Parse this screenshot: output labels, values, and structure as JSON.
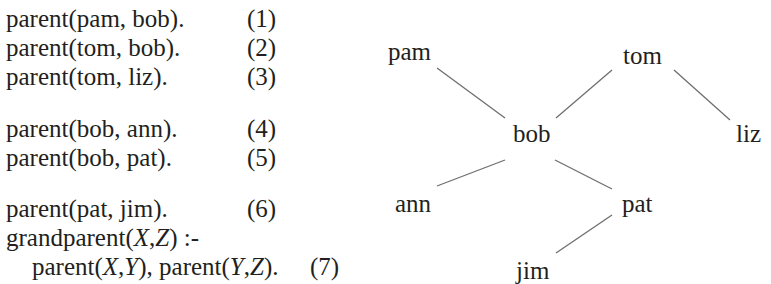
{
  "program": {
    "clauses": [
      {
        "text": "parent(pam, bob).",
        "number": "(1)"
      },
      {
        "text": "parent(tom, bob).",
        "number": "(2)"
      },
      {
        "text": "parent(tom, liz).",
        "number": "(3)"
      },
      {
        "text": "parent(bob, ann).",
        "number": "(4)"
      },
      {
        "text": "parent(bob, pat).",
        "number": "(5)"
      },
      {
        "text": "parent(pat, jim).",
        "number": "(6)"
      }
    ],
    "rule": {
      "head_pre": "grandparent(",
      "head_x": "X",
      "head_sep": ",",
      "head_z": "Z",
      "head_post": ") :-",
      "body_p1": "parent(",
      "body_x": "X",
      "body_sep1": ",",
      "body_y1": "Y",
      "body_mid": "), parent(",
      "body_y2": "Y",
      "body_sep2": ",",
      "body_z": "Z",
      "body_post": ").",
      "number": "(7)"
    }
  },
  "tree": {
    "nodes": {
      "pam": "pam",
      "tom": "tom",
      "bob": "bob",
      "liz": "liz",
      "ann": "ann",
      "pat": "pat",
      "jim": "jim"
    },
    "edges": [
      {
        "from": "pam",
        "to": "bob"
      },
      {
        "from": "tom",
        "to": "bob"
      },
      {
        "from": "tom",
        "to": "liz"
      },
      {
        "from": "bob",
        "to": "ann"
      },
      {
        "from": "bob",
        "to": "pat"
      },
      {
        "from": "pat",
        "to": "jim"
      }
    ]
  }
}
